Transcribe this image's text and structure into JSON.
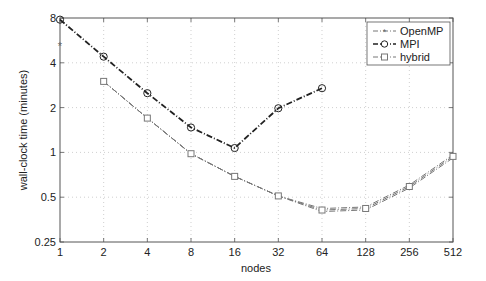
{
  "chart_data": {
    "type": "line",
    "title": "",
    "xlabel": "nodes",
    "ylabel": "wall-clock time (minutes)",
    "xscale": "log2",
    "yscale": "log2",
    "xlim": [
      1,
      512
    ],
    "ylim": [
      0.25,
      8
    ],
    "x_ticks": [
      1,
      2,
      4,
      8,
      16,
      32,
      64,
      128,
      256,
      512
    ],
    "y_ticks": [
      0.25,
      0.5,
      1,
      2,
      4,
      8
    ],
    "x_tick_labels": [
      "1",
      "2",
      "4",
      "8",
      "16",
      "32",
      "64",
      "128",
      "256",
      "512"
    ],
    "y_tick_labels": [
      "0.25",
      "0.5",
      "1",
      "2",
      "4",
      "8"
    ],
    "grid": true,
    "legend_position": "upper right",
    "series": [
      {
        "name": "OpenMP",
        "marker": "asterisk",
        "color": "#666666",
        "x": [
          1
        ],
        "values": [
          5.2
        ]
      },
      {
        "name": "MPI",
        "marker": "circle",
        "color": "#222222",
        "x": [
          1,
          2,
          4,
          8,
          16,
          32,
          64
        ],
        "values": [
          7.8,
          4.4,
          2.5,
          1.47,
          1.07,
          1.98,
          2.7
        ]
      },
      {
        "name": "hybrid",
        "marker": "square",
        "color": "#777777",
        "x": [
          2,
          4,
          8,
          16,
          32,
          64,
          128,
          256,
          512
        ],
        "values": [
          3.0,
          1.7,
          0.98,
          0.69,
          0.51,
          0.41,
          0.42,
          0.59,
          0.94
        ]
      }
    ]
  },
  "legend": {
    "items": [
      {
        "label": "OpenMP"
      },
      {
        "label": "MPI"
      },
      {
        "label": "hybrid"
      }
    ]
  }
}
